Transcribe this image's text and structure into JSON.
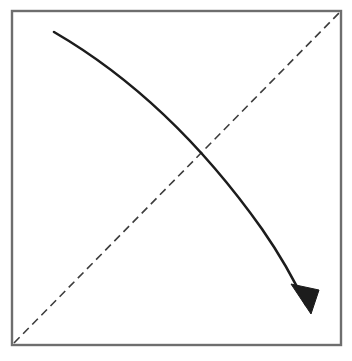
{
  "figure": {
    "canvas": {
      "width": 352,
      "height": 361,
      "background": "#ffffff"
    },
    "frame": {
      "name": "square-frame",
      "x": 12,
      "y": 11,
      "width": 329,
      "height": 334,
      "stroke": "#6e6e6e",
      "stroke_width": 2.4,
      "fill": "#ffffff"
    },
    "dashed_diagonal": {
      "name": "dashed-diagonal-line",
      "label": "reference diagonal",
      "from": {
        "x": 14,
        "y": 343
      },
      "to": {
        "x": 339,
        "y": 13
      },
      "stroke": "#3c3c3c",
      "stroke_width": 1.6,
      "dash_pattern": "8 5"
    },
    "curved_arrow": {
      "name": "curved-arrow",
      "label": "descending concave curve",
      "path": "M 54 32 C 140 82 206 150 262 229 C 285 262 298 288 306 305",
      "stroke": "#1c1c1c",
      "stroke_width": 2.6,
      "start_point": {
        "x": 54,
        "y": 32
      },
      "end_point": {
        "x": 306,
        "y": 305
      },
      "crossing_point": {
        "x": 207,
        "y": 150
      },
      "arrowhead": {
        "name": "arrowhead",
        "tip": {
          "x": 311,
          "y": 314
        },
        "points": "311,314 291,284 319,290",
        "fill": "#1c1c1c",
        "length": 22,
        "width": 20
      }
    }
  }
}
